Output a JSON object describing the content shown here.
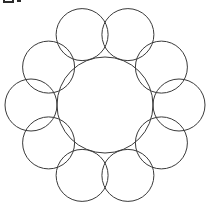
{
  "figure": {
    "background_color": "#ffffff",
    "stroke_color": "#3a3a3a",
    "stroke_width": 1,
    "canvas": {
      "width": 207,
      "height": 210
    },
    "corner_mark": {
      "name": "cropped-glyph-fragment",
      "description": "partial dark glyph cut off at the top edge",
      "color": "#2b2b2b"
    },
    "center_circle": {
      "label": "central circle",
      "cx": 105,
      "cy": 105,
      "r": 48
    },
    "satellite_count": 10,
    "satellite_radius": 26,
    "satellite_orbit_radius": 74,
    "satellites": [
      {
        "label": "satellite-1",
        "cx": 82.1,
        "cy": 34.6
      },
      {
        "label": "satellite-2",
        "cx": 127.9,
        "cy": 34.6
      },
      {
        "label": "satellite-3",
        "cx": 161.4,
        "cy": 67.1
      },
      {
        "label": "satellite-4",
        "cx": 179.0,
        "cy": 105.0
      },
      {
        "label": "satellite-5",
        "cx": 161.4,
        "cy": 142.9
      },
      {
        "label": "satellite-6",
        "cx": 127.9,
        "cy": 175.4
      },
      {
        "label": "satellite-7",
        "cx": 82.1,
        "cy": 175.4
      },
      {
        "label": "satellite-8",
        "cx": 48.6,
        "cy": 142.9
      },
      {
        "label": "satellite-9",
        "cx": 31.0,
        "cy": 105.0
      },
      {
        "label": "satellite-10",
        "cx": 48.6,
        "cy": 67.1
      }
    ]
  }
}
